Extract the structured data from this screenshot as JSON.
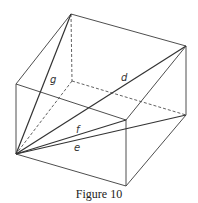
{
  "figure": {
    "caption": "Figure 10",
    "type": "rectangular box with space and face diagonals",
    "labels": {
      "g": "g",
      "d": "d",
      "f": "f",
      "e": "e"
    },
    "vertices": {
      "top_back": [
        71,
        14
      ],
      "top_right": [
        186,
        46
      ],
      "top_front": [
        126,
        120
      ],
      "top_left": [
        16,
        84
      ],
      "bottom_back": [
        72,
        81
      ],
      "bottom_right": [
        186,
        115
      ],
      "bottom_front": [
        126,
        186
      ],
      "bottom_left": [
        16,
        154
      ]
    }
  }
}
